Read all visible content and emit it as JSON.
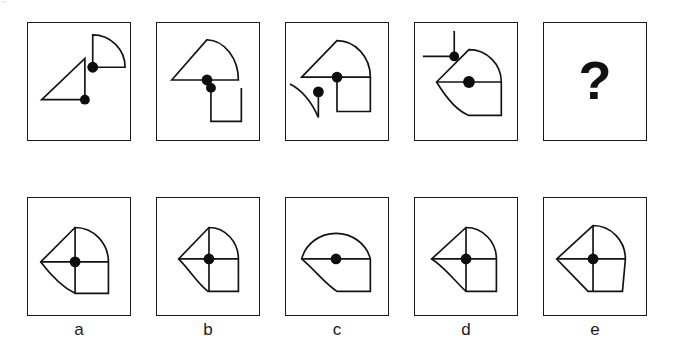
{
  "puzzle": {
    "type": "visual-analogy-matrix",
    "corner_mark": "''",
    "problem_row": {
      "name": "problem-sequence",
      "panels": [
        {
          "id": "problem-1",
          "position": 1,
          "description": "Right triangle with dot at bottom-right vertex, plus separate quarter-circle fan with dot at its corner",
          "shapes": [
            "right-triangle",
            "quarter-circle-fan"
          ],
          "dots": 2
        },
        {
          "id": "problem-2",
          "position": 2,
          "description": "Triangle merged with quarter-circle fan sharing a horizontal baseline with dot at junction, plus separate U-shape bracket with dot at its upper-left end",
          "shapes": [
            "triangle-fan-merge",
            "u-bracket"
          ],
          "dots": 2
        },
        {
          "id": "problem-3",
          "position": 3,
          "description": "Triangle-fan shape with square attached below right, dot at junction, plus separate curved hook line with dot at its end",
          "shapes": [
            "triangle-fan-square-merge",
            "curved-hook"
          ],
          "dots": 2
        },
        {
          "id": "problem-4",
          "position": 4,
          "description": "Compound shape: triangle point left, fan top right, curve bottom left, square bottom right, dot at center, plus separate T-shape with dot at its junction",
          "shapes": [
            "compound-assembly",
            "t-shape"
          ],
          "dots": 2
        },
        {
          "id": "problem-5",
          "position": 5,
          "description": "Unknown - answer to be selected",
          "shapes": [],
          "dots": 0,
          "question_mark": "?"
        }
      ]
    },
    "options_row": {
      "name": "answer-options",
      "options": [
        {
          "id": "option-a",
          "label": "a",
          "description": "Full compound: left-pointing triangle, quarter fan top-right, square bottom-right, curve bottom-left, cross divider lines, centered dot"
        },
        {
          "id": "option-b",
          "label": "b",
          "description": "Compound without upper-left triangle: fan top-right, square bottom-right, curve sweeping to left point, centered dot"
        },
        {
          "id": "option-c",
          "label": "c",
          "description": "Dome / semicircle top, square and curve below, horizontal divider, centered dot"
        },
        {
          "id": "option-d",
          "label": "d",
          "description": "Compound with short left spike, fan top-right, square bottom-right, curve bottom-left, centered dot"
        },
        {
          "id": "option-e",
          "label": "e",
          "description": "Full compound with large angular left triangle, fan top-right, angled square bottom-right, centered dot"
        }
      ]
    }
  }
}
